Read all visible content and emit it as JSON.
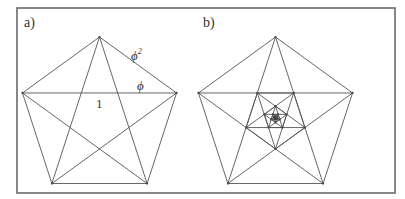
{
  "figure": {
    "frame": {
      "x": 17,
      "y": 8,
      "width": 378,
      "height": 185,
      "stroke": "#6a6a6a"
    },
    "line_color": "#555555",
    "panels": [
      {
        "id": "a",
        "label": "a)",
        "label_pos": [
          24,
          27
        ],
        "pentagon": {
          "cx": 99.5,
          "cy": 118,
          "r": 81,
          "rotation_deg": -90
        },
        "draw_pentagram": true,
        "recursion_depth": 0,
        "annotations": [
          {
            "text": "ϕ",
            "sup": "2",
            "x": 131,
            "y": 60,
            "meaning": "side of outer pentagon"
          },
          {
            "text": "ϕ",
            "sup": "",
            "x": 137,
            "y": 90,
            "meaning": "outer segment of diagonal"
          },
          {
            "text": "1",
            "sup": "",
            "x": 96,
            "y": 108,
            "meaning": "inner segment of diagonal"
          }
        ]
      },
      {
        "id": "b",
        "label": "b)",
        "label_pos": [
          203,
          27
        ],
        "pentagon": {
          "cx": 275.5,
          "cy": 118,
          "r": 81,
          "rotation_deg": -90
        },
        "draw_pentagram": true,
        "recursion_depth": 5,
        "scale_per_level": 0.381966,
        "annotations": []
      }
    ]
  }
}
